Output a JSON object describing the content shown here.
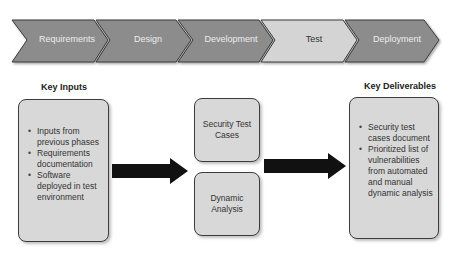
{
  "phases": [
    {
      "label": "Requirements",
      "active": false
    },
    {
      "label": "Design",
      "active": false
    },
    {
      "label": "Development",
      "active": false
    },
    {
      "label": "Test",
      "active": true
    },
    {
      "label": "Deployment",
      "active": false
    }
  ],
  "key_inputs": {
    "title": "Key Inputs",
    "items": [
      "Inputs from previous phases",
      "Requirements documentation",
      "Software deployed in test environment"
    ]
  },
  "activities": [
    "Security Test Cases",
    "Dynamic Analysis"
  ],
  "key_deliverables": {
    "title": "Key Deliverables",
    "items": [
      "Security test cases document",
      "Prioritized list of vulnerabilities from automated and manual dynamic analysis"
    ]
  },
  "colors": {
    "phase_fill": "#8c8c8c",
    "phase_active_fill": "#d4d4d4",
    "box_fill": "#d8d8d8",
    "arrow_fill": "#111111"
  }
}
